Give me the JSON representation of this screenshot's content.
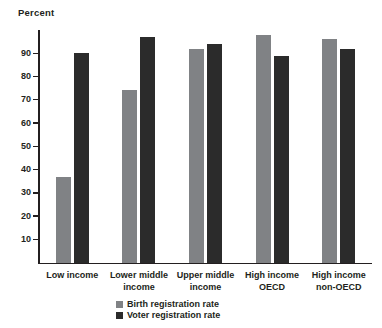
{
  "chart_data": {
    "type": "bar",
    "title": "",
    "ylabel": "Percent",
    "xlabel": "",
    "ylim": [
      0,
      100
    ],
    "yticks": [
      10,
      20,
      30,
      40,
      50,
      60,
      70,
      80,
      90
    ],
    "grid": false,
    "legend_position": "bottom-center",
    "categories": [
      "Low income",
      "Lower middle income",
      "Upper middle income",
      "High income OECD",
      "High income non-OECD"
    ],
    "category_lines": [
      [
        "Low income"
      ],
      [
        "Lower middle",
        "income"
      ],
      [
        "Upper middle",
        "income"
      ],
      [
        "High income",
        "OECD"
      ],
      [
        "High income",
        "non-OECD"
      ]
    ],
    "series": [
      {
        "name": "Birth registration rate",
        "color": "#808285",
        "values": [
          37,
          74,
          92,
          98,
          96
        ]
      },
      {
        "name": "Voter registration rate",
        "color": "#2b2b2b",
        "values": [
          90,
          97,
          94,
          89,
          92
        ]
      }
    ]
  },
  "legend": {
    "items": [
      {
        "label": "Birth registration rate"
      },
      {
        "label": "Voter registration rate"
      }
    ]
  }
}
